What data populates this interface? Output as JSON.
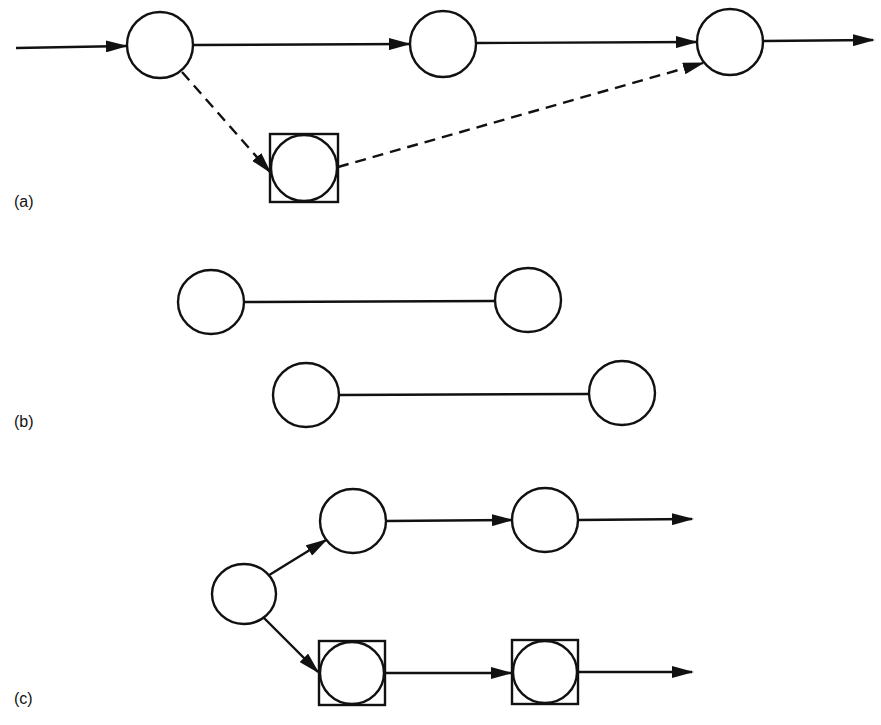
{
  "figure": {
    "panels": [
      {
        "label": "(a)",
        "label_pos": [
          14,
          207
        ],
        "nodes": [
          {
            "id": "a1",
            "cx": 160,
            "cy": 45,
            "rx": 33,
            "ry": 33,
            "boxed": false
          },
          {
            "id": "a2",
            "cx": 443,
            "cy": 44,
            "rx": 33,
            "ry": 33,
            "boxed": false
          },
          {
            "id": "a3",
            "cx": 730,
            "cy": 42,
            "rx": 33,
            "ry": 33,
            "boxed": false
          },
          {
            "id": "a4",
            "cx": 304,
            "cy": 168,
            "rx": 33,
            "ry": 33,
            "boxed": true
          }
        ],
        "edges": [
          {
            "from": "start",
            "to": "a1",
            "x1": 16,
            "y1": 48,
            "x2": 126,
            "y2": 46,
            "style": "solid",
            "arrow": true
          },
          {
            "from": "a1",
            "to": "a2",
            "x1": 194,
            "y1": 45,
            "x2": 409,
            "y2": 44,
            "style": "solid",
            "arrow": true
          },
          {
            "from": "a2",
            "to": "a3",
            "x1": 477,
            "y1": 43,
            "x2": 696,
            "y2": 42,
            "style": "solid",
            "arrow": true
          },
          {
            "from": "a3",
            "to": "end",
            "x1": 764,
            "y1": 41,
            "x2": 873,
            "y2": 40,
            "style": "solid",
            "arrow": true
          },
          {
            "from": "a1",
            "to": "a4",
            "x1": 182,
            "y1": 72,
            "x2": 270,
            "y2": 172,
            "style": "dashed",
            "arrow": true
          },
          {
            "from": "a4",
            "to": "a3",
            "x1": 338,
            "y1": 167,
            "x2": 703,
            "y2": 63,
            "style": "dashed",
            "arrow": true
          }
        ]
      },
      {
        "label": "(b)",
        "label_pos": [
          14,
          427
        ],
        "nodes": [
          {
            "id": "b1",
            "cx": 211,
            "cy": 302,
            "rx": 33,
            "ry": 32,
            "boxed": false
          },
          {
            "id": "b2",
            "cx": 528,
            "cy": 300,
            "rx": 33,
            "ry": 32,
            "boxed": false
          },
          {
            "id": "b3",
            "cx": 306,
            "cy": 395,
            "rx": 33,
            "ry": 32,
            "boxed": false
          },
          {
            "id": "b4",
            "cx": 622,
            "cy": 393,
            "rx": 33,
            "ry": 32,
            "boxed": false
          }
        ],
        "edges": [
          {
            "from": "b1",
            "to": "b2",
            "x1": 244,
            "y1": 302,
            "x2": 495,
            "y2": 301,
            "style": "solid",
            "arrow": false
          },
          {
            "from": "b3",
            "to": "b4",
            "x1": 339,
            "y1": 395,
            "x2": 589,
            "y2": 394,
            "style": "solid",
            "arrow": false
          }
        ]
      },
      {
        "label": "(c)",
        "label_pos": [
          14,
          704
        ],
        "nodes": [
          {
            "id": "c1",
            "cx": 244,
            "cy": 594,
            "rx": 32,
            "ry": 30,
            "boxed": false
          },
          {
            "id": "c2",
            "cx": 353,
            "cy": 521,
            "rx": 33,
            "ry": 32,
            "boxed": false
          },
          {
            "id": "c3",
            "cx": 545,
            "cy": 520,
            "rx": 33,
            "ry": 32,
            "boxed": false
          },
          {
            "id": "c4",
            "cx": 352,
            "cy": 673,
            "rx": 32,
            "ry": 31,
            "boxed": true
          },
          {
            "id": "c5",
            "cx": 545,
            "cy": 672,
            "rx": 32,
            "ry": 31,
            "boxed": true
          }
        ],
        "edges": [
          {
            "from": "c1",
            "to": "c2",
            "x1": 266,
            "y1": 577,
            "x2": 326,
            "y2": 540,
            "style": "solid",
            "arrow": true
          },
          {
            "from": "c1",
            "to": "c4",
            "x1": 264,
            "y1": 618,
            "x2": 318,
            "y2": 672,
            "style": "solid",
            "arrow": true
          },
          {
            "from": "c2",
            "to": "c3",
            "x1": 386,
            "y1": 521,
            "x2": 512,
            "y2": 520,
            "style": "solid",
            "arrow": true
          },
          {
            "from": "c3",
            "to": "end",
            "x1": 578,
            "y1": 520,
            "x2": 692,
            "y2": 519,
            "style": "solid",
            "arrow": true
          },
          {
            "from": "c4",
            "to": "c5",
            "x1": 386,
            "y1": 673,
            "x2": 511,
            "y2": 673,
            "style": "solid",
            "arrow": true
          },
          {
            "from": "c5",
            "to": "end",
            "x1": 579,
            "y1": 672,
            "x2": 692,
            "y2": 672,
            "style": "solid",
            "arrow": true
          }
        ]
      }
    ],
    "colors": {
      "stroke": "#111111",
      "background": "#ffffff"
    }
  }
}
